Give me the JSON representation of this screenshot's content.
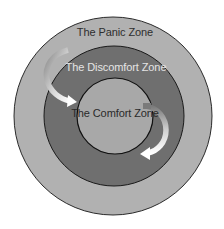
{
  "diagram": {
    "title": "",
    "zones": [
      {
        "id": "panic",
        "label": "The Panic Zone",
        "fill": "#b1b1b1",
        "text_color": "#2e2e2e"
      },
      {
        "id": "discomfort",
        "label": "The Discomfort Zone",
        "fill": "#6f6f6f",
        "text_color": "#e4e4e4"
      },
      {
        "id": "comfort",
        "label": "The Comfort Zone",
        "fill": "#a8a8a8",
        "text_color": "#2a2a2a"
      }
    ],
    "arrows": [
      {
        "id": "arrow-into-comfort",
        "from": "discomfort (upper-left)",
        "to": "comfort"
      },
      {
        "id": "arrow-out-of-comfort",
        "from": "comfort (right)",
        "to": "discomfort (lower-right)"
      }
    ],
    "colors": {
      "background": "#ffffff",
      "outline": "#1a1a1a",
      "arrow_head": "#ffffff",
      "arrow_tail": "#8a8a8a"
    }
  }
}
